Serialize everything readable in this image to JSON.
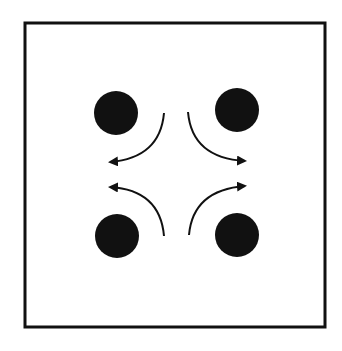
{
  "diagram": {
    "colors": {
      "stroke": "#111111",
      "fill": "#111111",
      "background": "#ffffff"
    },
    "frame": {
      "x": 24,
      "y": 22,
      "width": 302,
      "height": 306
    },
    "dots": [
      {
        "name": "top-left",
        "cx": 116,
        "cy": 113,
        "r": 22
      },
      {
        "name": "top-right",
        "cx": 237,
        "cy": 110,
        "r": 22
      },
      {
        "name": "bottom-left",
        "cx": 117,
        "cy": 236,
        "r": 22
      },
      {
        "name": "bottom-right",
        "cx": 237,
        "cy": 235,
        "r": 22
      }
    ],
    "arrows": [
      {
        "name": "top-left",
        "direction": "left"
      },
      {
        "name": "top-right",
        "direction": "right"
      },
      {
        "name": "bottom-left",
        "direction": "left"
      },
      {
        "name": "bottom-right",
        "direction": "right"
      }
    ]
  }
}
